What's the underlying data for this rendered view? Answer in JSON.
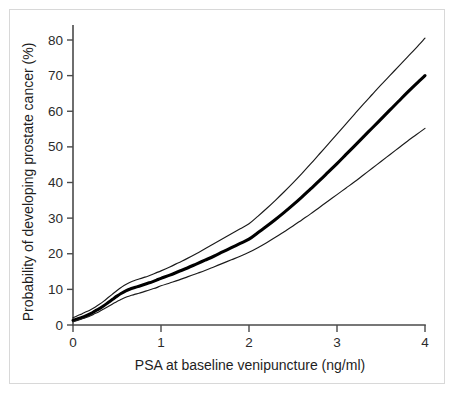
{
  "figure": {
    "background_color": "#ffffff",
    "frame_color": "#d8d8d8",
    "axis_color": "#4a4a4a"
  },
  "chart_data": {
    "type": "line",
    "title": "",
    "subtitle": "",
    "xlabel": "PSA at baseline venipuncture (ng/ml)",
    "ylabel": "Probability of developing prostate cancer (%)",
    "xlim": [
      0,
      4
    ],
    "ylim": [
      0,
      84
    ],
    "xticks": [
      0,
      1,
      2,
      3,
      4
    ],
    "yticks": [
      0,
      10,
      20,
      30,
      40,
      50,
      60,
      70,
      80
    ],
    "xtick_labels": [
      "0",
      "1",
      "2",
      "3",
      "4"
    ],
    "ytick_labels": [
      "0",
      "10",
      "20",
      "30",
      "40",
      "50",
      "60",
      "70",
      "80"
    ],
    "grid": false,
    "legend": null,
    "legend_position": "none",
    "annotations": [],
    "x": [
      0,
      0.05,
      0.1,
      0.15,
      0.2,
      0.25,
      0.3,
      0.35,
      0.4,
      0.45,
      0.5,
      0.55,
      0.6,
      0.65,
      0.7,
      0.75,
      0.8,
      0.85,
      0.9,
      0.95,
      1.0,
      1.1,
      1.2,
      1.3,
      1.4,
      1.5,
      1.6,
      1.7,
      1.8,
      1.9,
      2.0,
      2.1,
      2.2,
      2.3,
      2.4,
      2.5,
      2.6,
      2.7,
      2.8,
      2.9,
      3.0,
      3.1,
      3.2,
      3.3,
      3.4,
      3.5,
      3.6,
      3.7,
      3.8,
      3.9,
      4.0
    ],
    "series": [
      {
        "name": "Upper 95% confidence limit",
        "style": "thin",
        "values": [
          2.0,
          2.6,
          3.1,
          3.7,
          4.3,
          5.0,
          5.8,
          6.7,
          7.7,
          8.7,
          9.7,
          10.6,
          11.4,
          12.0,
          12.5,
          12.9,
          13.3,
          13.7,
          14.2,
          14.7,
          15.2,
          16.3,
          17.5,
          18.7,
          20.0,
          21.4,
          22.8,
          24.2,
          25.6,
          27.0,
          28.4,
          30.5,
          32.7,
          35.0,
          37.4,
          39.9,
          42.5,
          45.2,
          48.0,
          50.8,
          53.6,
          56.4,
          59.2,
          62.0,
          64.7,
          67.4,
          70.0,
          72.6,
          75.2,
          77.8,
          80.5
        ]
      },
      {
        "name": "Estimated probability",
        "style": "bold",
        "values": [
          1.3,
          1.7,
          2.1,
          2.6,
          3.2,
          3.9,
          4.6,
          5.4,
          6.3,
          7.2,
          8.1,
          8.9,
          9.6,
          10.1,
          10.5,
          10.9,
          11.3,
          11.7,
          12.1,
          12.6,
          13.1,
          14.0,
          15.0,
          16.0,
          17.1,
          18.2,
          19.3,
          20.5,
          21.7,
          22.9,
          24.1,
          25.9,
          27.7,
          29.6,
          31.6,
          33.7,
          35.9,
          38.2,
          40.5,
          42.9,
          45.3,
          47.8,
          50.3,
          52.8,
          55.3,
          57.8,
          60.3,
          62.8,
          65.3,
          67.7,
          70.0
        ]
      },
      {
        "name": "Lower 95% confidence limit",
        "style": "thin",
        "values": [
          0.9,
          1.3,
          1.7,
          2.1,
          2.6,
          3.2,
          3.8,
          4.5,
          5.2,
          5.9,
          6.6,
          7.2,
          7.8,
          8.2,
          8.6,
          8.9,
          9.3,
          9.7,
          10.1,
          10.5,
          11.0,
          11.8,
          12.6,
          13.5,
          14.4,
          15.3,
          16.3,
          17.3,
          18.3,
          19.3,
          20.4,
          21.7,
          23.1,
          24.6,
          26.2,
          27.8,
          29.5,
          31.2,
          33.0,
          34.8,
          36.6,
          38.4,
          40.2,
          42.1,
          44.0,
          45.9,
          47.8,
          49.7,
          51.6,
          53.4,
          55.2
        ]
      }
    ]
  }
}
